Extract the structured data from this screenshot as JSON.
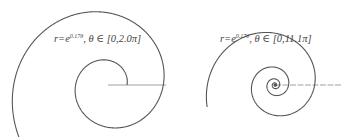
{
  "chart_data": [
    {
      "type": "line",
      "subtype": "polar-spiral",
      "title": "r=e^{0.17θ}, θ ∈ [0,2.0π]",
      "equation": "r = e^{0.17θ}",
      "k": 0.17,
      "theta_range_label": "[0,2.0π]",
      "theta_start": 0,
      "theta_end_pi": 3.3,
      "pole": [
        108,
        85
      ],
      "scale": 19,
      "axis": {
        "x_start": 108,
        "x_end": 166,
        "y": 85
      },
      "color": "#555555"
    },
    {
      "type": "line",
      "subtype": "polar-spiral",
      "title": "r=e^{0.17θ}, θ ∈ [0,11.1π]",
      "equation": "r = e^{0.17θ}",
      "k": 0.17,
      "theta_range_label": "[0,11.1π]",
      "theta_start": 0,
      "theta_end_pi": 11.1,
      "pole": [
        275,
        85
      ],
      "scale": 0.19,
      "axis": {
        "x_start": 275,
        "x_end": 342,
        "y": 85
      },
      "color": "#555555"
    }
  ],
  "labels": {
    "left": {
      "r": "r",
      "eq": "=e",
      "exp": "0.17θ",
      "tail": ", θ ∈ [0,2.0π]"
    },
    "right": {
      "r": "r",
      "eq": "=e",
      "exp": "0.17θ",
      "tail": ", θ ∈ [0,11.1π]"
    }
  }
}
